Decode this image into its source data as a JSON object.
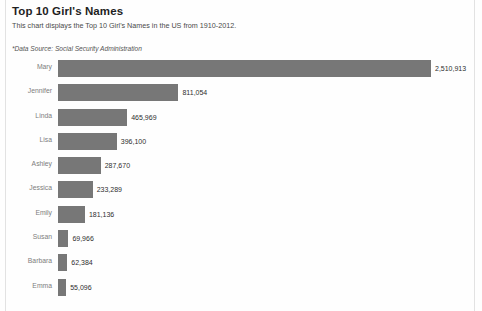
{
  "header": {
    "title": "Top 10 Girl's Names",
    "subtitle": "This chart displays the Top 10 Girl's Names in the US from 1910-2012.",
    "source": "*Data Source: Social Security Administration"
  },
  "colors": {
    "bar": "#777777",
    "category_label": "#7d7d7d",
    "value_label": "#2e2e2e",
    "frame_rule": "#e2e2e2",
    "background": "#fefefe"
  },
  "chart_data": {
    "type": "bar",
    "orientation": "horizontal",
    "title": "Top 10 Girl's Names",
    "subtitle": "This chart displays the Top 10 Girl's Names in the US from 1910-2012.",
    "annotation": "*Data Source: Social Security Administration",
    "xlabel": "",
    "ylabel": "",
    "grid": false,
    "legend": "none",
    "xlim": [
      0,
      2510913
    ],
    "categories": [
      "Mary",
      "Jennifer",
      "Linda",
      "Lisa",
      "Ashley",
      "Jessica",
      "Emily",
      "Susan",
      "Barbara",
      "Emma"
    ],
    "values": [
      2510913,
      811054,
      465969,
      396100,
      287670,
      233289,
      181136,
      69966,
      62384,
      55096
    ],
    "value_labels": [
      "2,510,913",
      "811,054",
      "465,969",
      "396,100",
      "287,670",
      "233,289",
      "181,136",
      "69,966",
      "62,384",
      "55,096"
    ]
  }
}
